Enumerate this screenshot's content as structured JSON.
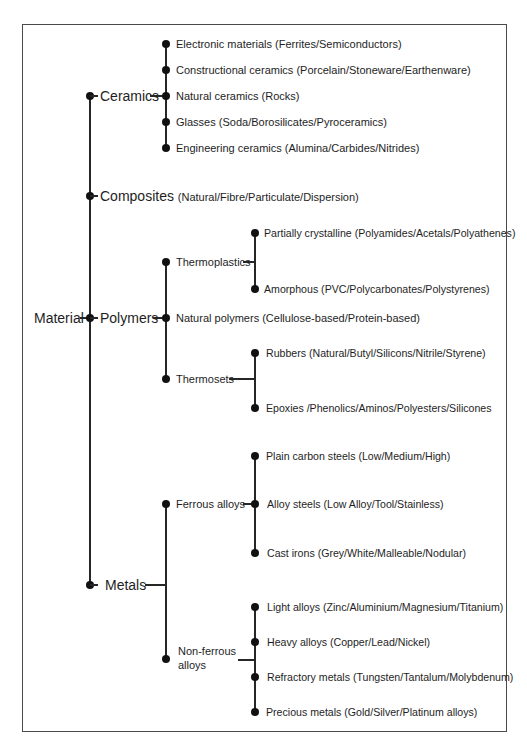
{
  "diagram": {
    "type": "tree",
    "root": "Material",
    "categories": [
      {
        "label": "Ceramics",
        "detail": "",
        "children": [
          {
            "label": "Electronic materials (Ferrites/Semiconductors)"
          },
          {
            "label": "Constructional ceramics (Porcelain/Stoneware/Earthenware)"
          },
          {
            "label": "Natural ceramics (Rocks)"
          },
          {
            "label": "Glasses (Soda/Borosilicates/Pyroceramics)"
          },
          {
            "label": "Engineering ceramics (Alumina/Carbides/Nitrides)"
          }
        ]
      },
      {
        "label": "Composites",
        "detail": "(Natural/Fibre/Particulate/Dispersion)",
        "children": []
      },
      {
        "label": "Polymers",
        "detail": "",
        "children": [
          {
            "label": "Thermoplastics",
            "children": [
              {
                "label": "Partially crystalline (Polyamides/Acetals/Polyathenes)"
              },
              {
                "label": "Amorphous  (PVC/Polycarbonates/Polystyrenes)"
              }
            ]
          },
          {
            "label": "Natural polymers  (Cellulose-based/Protein-based)"
          },
          {
            "label": "Thermosets",
            "children": [
              {
                "label": "Rubbers  (Natural/Butyl/Silicons/Nitrile/Styrene)"
              },
              {
                "label": "Epoxies /Phenolics/Aminos/Polyesters/Silicones"
              }
            ]
          }
        ]
      },
      {
        "label": "Metals",
        "detail": "",
        "children": [
          {
            "label": "Ferrous alloys",
            "children": [
              {
                "label": "Plain carbon steels  (Low/Medium/High)"
              },
              {
                "label": "Alloy steels  (Low Alloy/Tool/Stainless)"
              },
              {
                "label": "Cast irons (Grey/White/Malleable/Nodular)"
              }
            ]
          },
          {
            "label": "Non-ferrous alloys",
            "label_line1": "Non-ferrous",
            "label_line2": "alloys",
            "children": [
              {
                "label": "Light alloys (Zinc/Aluminium/Magnesium/Titanium)"
              },
              {
                "label": "Heavy alloys (Copper/Lead/Nickel)"
              },
              {
                "label": "Refractory metals (Tungsten/Tantalum/Molybdenum)"
              },
              {
                "label": "Precious metals (Gold/Silver/Platinum alloys)"
              }
            ]
          }
        ]
      }
    ]
  },
  "colors": {
    "line": "#262626",
    "dot": "#111111",
    "frame": "#4a4a4a",
    "text": "#1e1e1e",
    "background": "#ffffff"
  }
}
